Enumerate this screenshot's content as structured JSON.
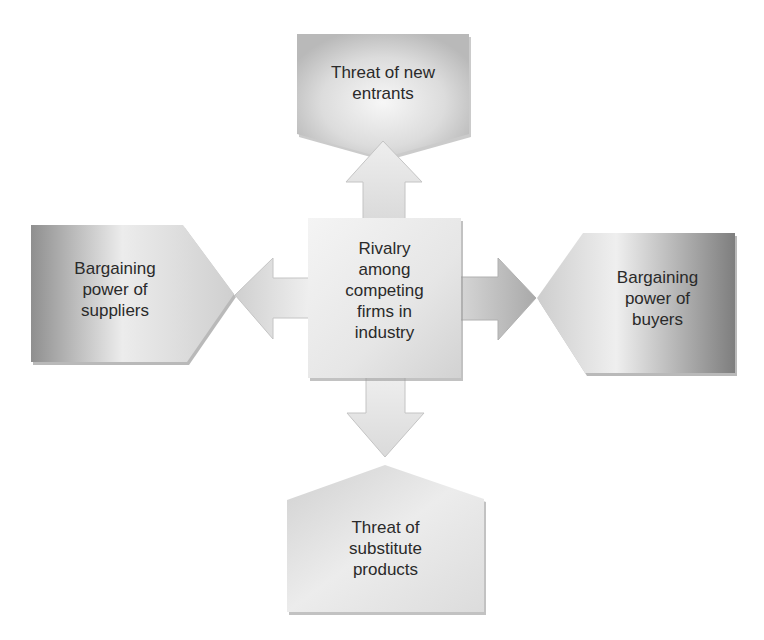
{
  "diagram": {
    "center": {
      "lines": [
        "Rivalry",
        "among",
        "competing",
        "firms in",
        "industry"
      ]
    },
    "top": {
      "lines": [
        "Threat of new",
        "entrants"
      ]
    },
    "left": {
      "lines": [
        "Bargaining",
        "power of",
        "suppliers"
      ]
    },
    "right": {
      "lines": [
        "Bargaining",
        "power of",
        "buyers"
      ]
    },
    "bottom": {
      "lines": [
        "Threat of",
        "substitute",
        "products"
      ]
    },
    "colors": {
      "box_light": "#f2f2f2",
      "box_mid": "#d4d4d4",
      "box_dark": "#8c8c8c",
      "shadow": "#9a9a9a",
      "text": "#2a2a2a",
      "background": "#ffffff"
    }
  }
}
